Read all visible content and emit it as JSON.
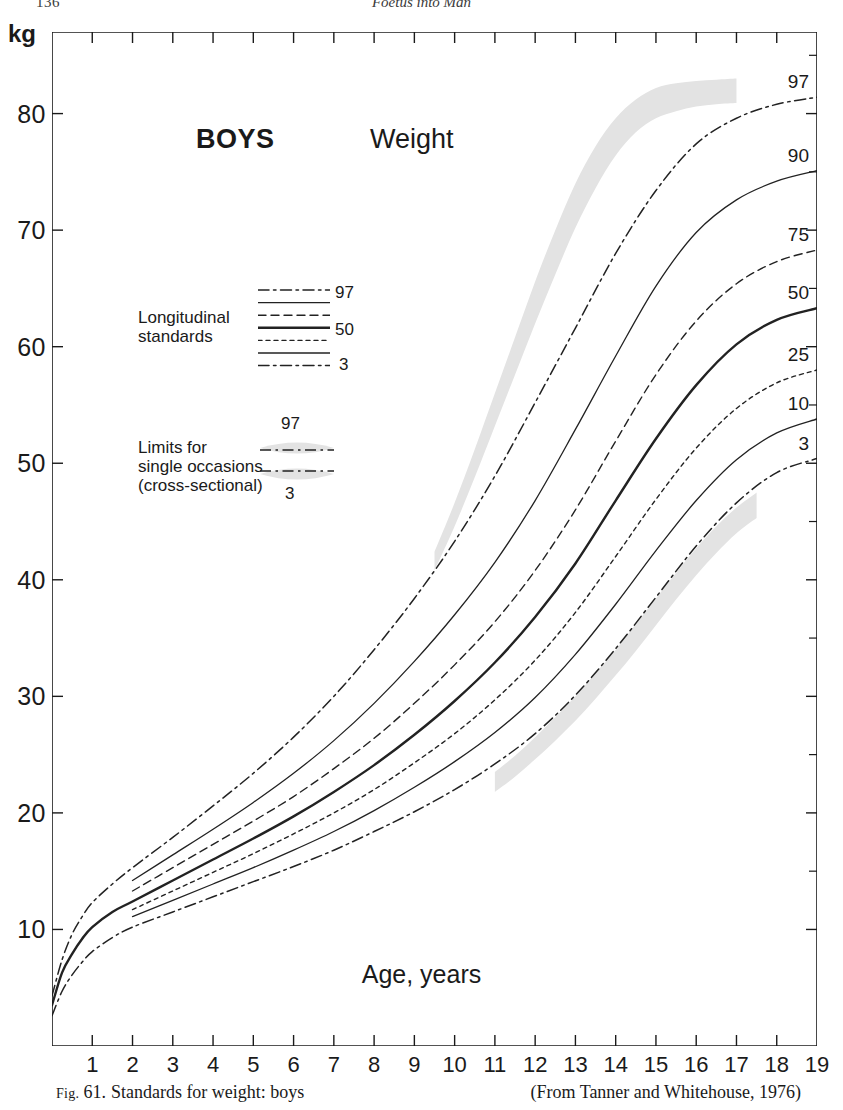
{
  "running_head": {
    "folio": "136",
    "book_title": "Foetus into Man"
  },
  "figure": {
    "title_main": "BOYS",
    "title_measure": "Weight",
    "unit_label": "kg",
    "x_axis_title": "Age, years"
  },
  "legend": {
    "longitudinal": {
      "text_line1": "Longitudinal",
      "text_line2": "standards",
      "label_top": "97",
      "label_mid": "50",
      "label_bottom": "3"
    },
    "cross_sectional": {
      "text_line1": "Limits for",
      "text_line2": "single occasions",
      "text_line3": "(cross-sectional)",
      "label_top": "97",
      "label_bottom": "3"
    }
  },
  "caption": {
    "fig_label": "Fig.",
    "fig_number": "61.",
    "text": "Standards for weight: boys",
    "source": "(From Tanner and Whitehouse, 1976)"
  },
  "colors": {
    "ink": "#1a1a1a",
    "curve": "#222222",
    "band_fill": "#e3e3e3",
    "axis": "#1a1a1a"
  },
  "chart_data": {
    "type": "line",
    "title": "Standards for weight: boys",
    "xlabel": "Age, years",
    "ylabel": "kg",
    "xlim": [
      0,
      19
    ],
    "ylim": [
      0,
      87
    ],
    "grid": false,
    "legend_position": "inside-left",
    "x_ticks": [
      0,
      1,
      2,
      3,
      4,
      5,
      6,
      7,
      8,
      9,
      10,
      11,
      12,
      13,
      14,
      15,
      16,
      17,
      18,
      19
    ],
    "x_tick_labels": [
      "",
      "1",
      "2",
      "3",
      "4",
      "5",
      "6",
      "7",
      "8",
      "9",
      "10",
      "11",
      "12",
      "13",
      "14",
      "15",
      "16",
      "17",
      "18",
      "19"
    ],
    "y_ticks": [
      10,
      20,
      30,
      40,
      50,
      60,
      70,
      80
    ],
    "y_tick_labels": [
      "10",
      "20",
      "30",
      "40",
      "50",
      "60",
      "70",
      "80"
    ],
    "end_labels": [
      "97",
      "90",
      "75",
      "50",
      "25",
      "10",
      "3"
    ],
    "x": [
      0,
      0.25,
      0.5,
      0.75,
      1,
      1.5,
      2,
      3,
      4,
      5,
      6,
      7,
      8,
      9,
      10,
      11,
      12,
      13,
      14,
      15,
      16,
      17,
      18,
      19
    ],
    "series": [
      {
        "name": "97",
        "style": "dash-dot",
        "end_label": "97",
        "values": [
          4.3,
          7.4,
          9.6,
          11.1,
          12.3,
          13.9,
          15.3,
          17.9,
          20.6,
          23.4,
          26.5,
          30.0,
          34.0,
          38.4,
          43.3,
          48.9,
          55.2,
          61.6,
          68.0,
          73.4,
          77.4,
          79.6,
          80.8,
          81.4
        ]
      },
      {
        "name": "90",
        "style": "solid-thin",
        "end_label": "90",
        "values": [
          null,
          null,
          null,
          null,
          null,
          null,
          14.2,
          16.4,
          18.6,
          20.9,
          23.4,
          26.2,
          29.4,
          33.0,
          37.0,
          41.5,
          46.8,
          52.9,
          59.2,
          65.2,
          69.8,
          72.6,
          74.2,
          75.1
        ]
      },
      {
        "name": "75",
        "style": "dashed",
        "end_label": "75",
        "values": [
          null,
          null,
          null,
          null,
          null,
          null,
          13.3,
          15.3,
          17.3,
          19.3,
          21.4,
          23.8,
          26.4,
          29.4,
          32.7,
          36.4,
          40.8,
          46.0,
          51.9,
          57.6,
          62.2,
          65.4,
          67.3,
          68.3
        ]
      },
      {
        "name": "50",
        "style": "solid-thick",
        "end_label": "50",
        "values": [
          3.5,
          6.3,
          7.9,
          9.2,
          10.2,
          11.5,
          12.4,
          14.2,
          16.0,
          17.8,
          19.7,
          21.8,
          24.1,
          26.7,
          29.6,
          32.9,
          36.8,
          41.4,
          46.8,
          52.1,
          56.7,
          60.2,
          62.3,
          63.3
        ]
      },
      {
        "name": "25",
        "style": "dotted",
        "end_label": "25",
        "values": [
          null,
          null,
          null,
          null,
          null,
          null,
          11.7,
          13.3,
          14.9,
          16.5,
          18.2,
          20.0,
          22.0,
          24.3,
          26.8,
          29.7,
          33.1,
          37.2,
          42.0,
          46.9,
          51.3,
          54.7,
          56.9,
          58.0
        ]
      },
      {
        "name": "10",
        "style": "solid-thin",
        "end_label": "10",
        "values": [
          null,
          null,
          null,
          null,
          null,
          null,
          11.1,
          12.5,
          13.9,
          15.3,
          16.8,
          18.4,
          20.2,
          22.2,
          24.4,
          26.9,
          29.9,
          33.6,
          37.9,
          42.5,
          46.8,
          50.3,
          52.6,
          53.8
        ]
      },
      {
        "name": "3",
        "style": "dash-dot",
        "end_label": "3",
        "values": [
          2.6,
          4.7,
          6.1,
          7.2,
          8.1,
          9.3,
          10.2,
          11.5,
          12.8,
          14.1,
          15.4,
          16.8,
          18.4,
          20.1,
          22.0,
          24.2,
          26.8,
          30.1,
          34.1,
          38.5,
          42.9,
          46.6,
          49.2,
          50.4
        ]
      }
    ],
    "bands": [
      {
        "name": "cross-sectional-upper-97",
        "description": "shaded limits for single occasions above the 97th longitudinal curve",
        "x": [
          9.5,
          10,
          10.5,
          11,
          11.5,
          12,
          12.5,
          13,
          13.5,
          14,
          14.5,
          15,
          15.5,
          16,
          16.5,
          17
        ],
        "upper": [
          42.4,
          46.6,
          51.2,
          56.0,
          60.8,
          65.6,
          70.0,
          74.0,
          77.2,
          79.6,
          81.2,
          82.2,
          82.6,
          82.8,
          82.9,
          83.0
        ],
        "lower": [
          40.8,
          44.6,
          48.8,
          53.2,
          57.6,
          62.0,
          66.2,
          70.2,
          73.6,
          76.4,
          78.4,
          79.6,
          80.2,
          80.6,
          80.8,
          80.9
        ]
      },
      {
        "name": "cross-sectional-lower-3",
        "description": "shaded limits for single occasions below the 3rd longitudinal curve",
        "x": [
          11,
          11.5,
          12,
          12.5,
          13,
          13.5,
          14,
          14.5,
          15,
          15.5,
          16,
          16.5,
          17,
          17.5
        ],
        "upper": [
          23.5,
          24.9,
          26.5,
          28.2,
          30.0,
          32.0,
          34.0,
          36.2,
          38.4,
          40.6,
          42.7,
          44.6,
          46.2,
          47.5
        ],
        "lower": [
          21.8,
          23.1,
          24.6,
          26.2,
          27.9,
          29.8,
          31.8,
          33.9,
          36.1,
          38.3,
          40.4,
          42.3,
          44.0,
          45.3
        ]
      }
    ]
  }
}
